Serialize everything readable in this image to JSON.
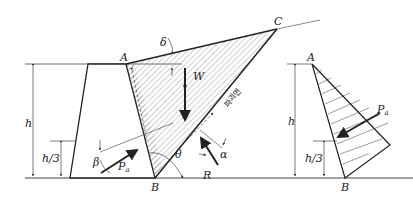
{
  "diagram": {
    "labels": {
      "A": "A",
      "B": "B",
      "C": "C",
      "W": "W",
      "R": "R",
      "Pa": "P",
      "Pa_sub": "a",
      "h": "h",
      "h3": "h/3",
      "delta": "δ",
      "beta": "β",
      "theta": "θ",
      "alpha": "α",
      "failure_plane": "파괴면"
    },
    "right_diagram": {
      "A": "A",
      "B": "B",
      "h": "h",
      "h3": "h/3",
      "Pa": "P",
      "Pa_sub": "a"
    },
    "colors": {
      "line": "#222222",
      "thin": "#555555",
      "hatch": "#777777"
    }
  }
}
